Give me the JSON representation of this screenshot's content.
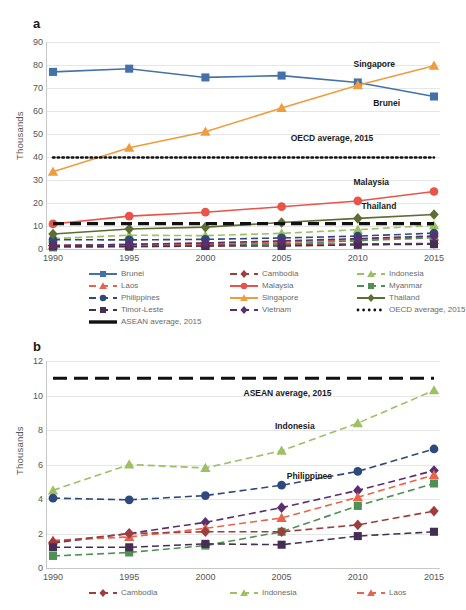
{
  "panel_a": {
    "letter": "a",
    "ylabel": "Thousands",
    "ytick_labels": [
      "0",
      "10",
      "20",
      "30",
      "40",
      "50",
      "60",
      "70",
      "80",
      "90"
    ],
    "xtick_labels": [
      "1990",
      "1995",
      "2000",
      "2005",
      "2010",
      "2015"
    ],
    "annotations": [
      {
        "text": "Singapore",
        "x": 78,
        "y": 8
      },
      {
        "text": "Brunei",
        "x": 83,
        "y": 27
      },
      {
        "text": "OECD average, 2015",
        "x": 62,
        "y": 44
      },
      {
        "text": "Malaysia",
        "x": 78,
        "y": 65
      },
      {
        "text": "Thailand",
        "x": 80,
        "y": 77
      }
    ],
    "legend": [
      {
        "label": "Brunei",
        "color": "#4472a8",
        "style": "solid",
        "marker": "square",
        "col": 0,
        "row": 0
      },
      {
        "label": "Cambodia",
        "color": "#9e3d3d",
        "style": "dashed",
        "marker": "diamond",
        "col": 1,
        "row": 0
      },
      {
        "label": "Indonesia",
        "color": "#9cc063",
        "style": "dashed",
        "marker": "triangle",
        "col": 2,
        "row": 0
      },
      {
        "label": "Laos",
        "color": "#e8644c",
        "style": "dashed",
        "marker": "triangle",
        "col": 0,
        "row": 1
      },
      {
        "label": "Malaysia",
        "color": "#e8544a",
        "style": "solid",
        "marker": "circle",
        "col": 1,
        "row": 1
      },
      {
        "label": "Myanmar",
        "color": "#4e9152",
        "style": "dashed",
        "marker": "square",
        "col": 2,
        "row": 1
      },
      {
        "label": "Philippines",
        "color": "#2e4a7d",
        "style": "dashed",
        "marker": "circle",
        "col": 0,
        "row": 2
      },
      {
        "label": "Singapore",
        "color": "#ed9c3e",
        "style": "solid",
        "marker": "triangle",
        "col": 1,
        "row": 2
      },
      {
        "label": "Thailand",
        "color": "#5c6e34",
        "style": "solid",
        "marker": "diamond",
        "col": 2,
        "row": 2
      },
      {
        "label": "Timor-Leste",
        "color": "#452d54",
        "style": "dashed",
        "marker": "square",
        "col": 0,
        "row": 3
      },
      {
        "label": "Vietnam",
        "color": "#5b2f6e",
        "style": "dashed",
        "marker": "diamond",
        "col": 1,
        "row": 3
      },
      {
        "label": "OECD average, 2015",
        "color": "#111111",
        "style": "dotted",
        "marker": "none",
        "col": 2,
        "row": 3
      },
      {
        "label": "ASEAN average, 2015",
        "color": "#111111",
        "style": "thick",
        "marker": "none",
        "col": 0,
        "row": 4
      }
    ]
  },
  "panel_b": {
    "letter": "b",
    "ylabel": "Thousands",
    "ytick_labels": [
      "0",
      "2",
      "4",
      "6",
      "8",
      "10",
      "12"
    ],
    "xtick_labels": [
      "1990",
      "1995",
      "2000",
      "2005",
      "2010",
      "2015"
    ],
    "annotations": [
      {
        "text": "ASEAN average, 2015",
        "x": 50,
        "y": 13
      },
      {
        "text": "Indonesia",
        "x": 58,
        "y": 29
      },
      {
        "text": "Philippines",
        "x": 61,
        "y": 53
      }
    ],
    "legend": [
      {
        "label": "Cambodia",
        "color": "#9e3d3d",
        "style": "dashed",
        "marker": "diamond",
        "col": 0,
        "row": 0
      },
      {
        "label": "Indonesia",
        "color": "#9cc063",
        "style": "dashed",
        "marker": "triangle",
        "col": 1,
        "row": 0
      },
      {
        "label": "Laos",
        "color": "#e8644c",
        "style": "dashed",
        "marker": "triangle",
        "col": 2,
        "row": 0
      }
    ]
  },
  "chart_data": [
    {
      "id": "panel_a",
      "type": "line",
      "title": "",
      "xlabel": "",
      "ylabel": "Thousands",
      "x": [
        1990,
        1995,
        2000,
        2005,
        2010,
        2015
      ],
      "ylim": [
        0,
        90
      ],
      "ytick_step": 10,
      "grid": true,
      "legend_position": "bottom",
      "series": [
        {
          "name": "Brunei",
          "color": "#4472a8",
          "style": "solid",
          "marker": "square",
          "values": [
            77.0,
            78.4,
            74.6,
            75.4,
            72.4,
            66.3
          ]
        },
        {
          "name": "Cambodia",
          "color": "#9e3d3d",
          "style": "dashed",
          "marker": "diamond",
          "values": [
            1.5,
            2.0,
            2.1,
            2.1,
            2.2,
            2.4
          ]
        },
        {
          "name": "Indonesia",
          "color": "#9cc063",
          "style": "dashed",
          "marker": "triangle",
          "values": [
            4.5,
            6.0,
            5.8,
            6.8,
            8.4,
            10.3
          ]
        },
        {
          "name": "Laos",
          "color": "#e8644c",
          "style": "dashed",
          "marker": "triangle",
          "values": [
            1.6,
            1.8,
            2.3,
            2.9,
            4.1,
            5.4
          ]
        },
        {
          "name": "Malaysia",
          "color": "#e8544a",
          "style": "solid",
          "marker": "circle",
          "values": [
            10.9,
            14.3,
            16.0,
            18.4,
            20.9,
            25.0
          ]
        },
        {
          "name": "Myanmar",
          "color": "#4e9152",
          "style": "dashed",
          "marker": "square",
          "values": [
            0.7,
            0.9,
            1.3,
            2.1,
            3.6,
            4.9
          ]
        },
        {
          "name": "Philippines",
          "color": "#2e4a7d",
          "style": "dashed",
          "marker": "circle",
          "values": [
            4.05,
            3.95,
            4.2,
            4.8,
            5.6,
            6.9
          ]
        },
        {
          "name": "Singapore",
          "color": "#ed9c3e",
          "style": "solid",
          "marker": "triangle",
          "values": [
            33.6,
            44.0,
            51.0,
            61.3,
            71.2,
            79.7
          ]
        },
        {
          "name": "Thailand",
          "color": "#5c6e34",
          "style": "solid",
          "marker": "diamond",
          "values": [
            6.5,
            8.7,
            9.5,
            11.5,
            13.3,
            15.0
          ]
        },
        {
          "name": "Timor-Leste",
          "color": "#452d54",
          "style": "dashed",
          "marker": "square",
          "values": [
            1.2,
            1.2,
            1.3,
            1.3,
            1.8,
            2.1
          ]
        },
        {
          "name": "Vietnam",
          "color": "#5b2f6e",
          "style": "dashed",
          "marker": "diamond",
          "values": [
            1.45,
            2.0,
            2.65,
            3.5,
            4.5,
            5.65
          ]
        },
        {
          "name": "OECD average, 2015",
          "color": "#111111",
          "style": "dotted",
          "marker": "none",
          "values": [
            39.8,
            39.8,
            39.8,
            39.8,
            39.8,
            39.8
          ]
        },
        {
          "name": "ASEAN average, 2015",
          "color": "#111111",
          "style": "thick",
          "marker": "none",
          "values": [
            11.0,
            11.0,
            11.0,
            11.0,
            11.0,
            11.0
          ]
        }
      ]
    },
    {
      "id": "panel_b",
      "type": "line",
      "title": "",
      "xlabel": "",
      "ylabel": "Thousands",
      "x": [
        1990,
        1995,
        2000,
        2005,
        2010,
        2015
      ],
      "ylim": [
        0,
        12
      ],
      "ytick_step": 2,
      "grid": true,
      "legend_position": "bottom",
      "series": [
        {
          "name": "ASEAN average, 2015",
          "color": "#111111",
          "style": "thick",
          "marker": "none",
          "values": [
            11.0,
            11.0,
            11.0,
            11.0,
            11.0,
            11.0
          ]
        },
        {
          "name": "Indonesia",
          "color": "#9cc063",
          "style": "dashed",
          "marker": "triangle",
          "values": [
            4.5,
            6.0,
            5.8,
            6.8,
            8.4,
            10.3
          ]
        },
        {
          "name": "Philippines",
          "color": "#2e4a7d",
          "style": "dashed",
          "marker": "circle",
          "values": [
            4.05,
            3.95,
            4.2,
            4.8,
            5.6,
            6.9
          ]
        },
        {
          "name": "Vietnam",
          "color": "#5b2f6e",
          "style": "dashed",
          "marker": "diamond",
          "values": [
            1.45,
            2.0,
            2.65,
            3.5,
            4.5,
            5.65
          ]
        },
        {
          "name": "Laos",
          "color": "#e8644c",
          "style": "dashed",
          "marker": "triangle",
          "values": [
            1.6,
            1.8,
            2.3,
            2.9,
            4.1,
            5.4
          ]
        },
        {
          "name": "Myanmar",
          "color": "#4e9152",
          "style": "dashed",
          "marker": "square",
          "values": [
            0.7,
            0.9,
            1.3,
            2.1,
            3.6,
            4.9
          ]
        },
        {
          "name": "Cambodia",
          "color": "#9e3d3d",
          "style": "dashed",
          "marker": "diamond",
          "values": [
            1.5,
            2.0,
            2.1,
            2.1,
            2.5,
            3.3
          ]
        },
        {
          "name": "Timor-Leste",
          "color": "#452d54",
          "style": "dashed",
          "marker": "square",
          "values": [
            1.2,
            1.2,
            1.4,
            1.35,
            1.85,
            2.1
          ]
        }
      ]
    }
  ]
}
